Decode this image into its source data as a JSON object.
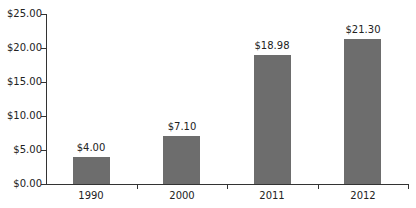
{
  "chart_data": {
    "type": "bar",
    "title": "",
    "xlabel": "",
    "ylabel": "",
    "categories": [
      "1990",
      "2000",
      "2011",
      "2012"
    ],
    "values": [
      4.0,
      7.1,
      18.98,
      21.3
    ],
    "value_labels": [
      "$4.00",
      "$7.10",
      "$18.98",
      "$21.30"
    ],
    "ylim": [
      0,
      25
    ],
    "yticks": [
      "$0.00",
      "$5.00",
      "$10.00",
      "$15.00",
      "$20.00",
      "$25.00"
    ],
    "grid": false,
    "legend": null,
    "bar_color": "#6d6d6d"
  }
}
